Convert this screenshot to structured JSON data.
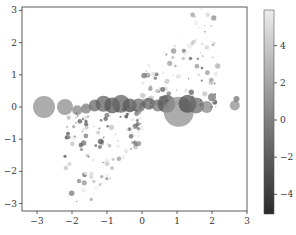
{
  "chart_data": {
    "type": "scatter",
    "title": "",
    "xlabel": "",
    "ylabel": "",
    "xlim": [
      -3.3,
      3.1
    ],
    "ylim": [
      -3.1,
      3.2
    ],
    "xticks": [
      -3,
      -2,
      -1,
      0,
      1,
      2,
      3
    ],
    "yticks": [
      -3,
      -2,
      -1,
      0,
      1,
      2,
      3
    ],
    "grid": false,
    "colormap": "gray",
    "colorbar": {
      "ticks": [
        4,
        2,
        0,
        -2,
        -4
      ],
      "range": [
        -5,
        5.5
      ],
      "position": "right"
    },
    "bubbles": [
      {
        "x": -2.8,
        "y": 0.0,
        "r": 11,
        "c": 0.5
      },
      {
        "x": -2.2,
        "y": 0.0,
        "r": 8,
        "c": 0.3
      },
      {
        "x": -1.85,
        "y": -0.1,
        "r": 5,
        "c": 0.0
      },
      {
        "x": -1.6,
        "y": -0.05,
        "r": 5,
        "c": -0.5
      },
      {
        "x": -1.35,
        "y": 0.05,
        "r": 6,
        "c": -1.5
      },
      {
        "x": -1.1,
        "y": 0.1,
        "r": 8,
        "c": -2.0
      },
      {
        "x": -0.85,
        "y": 0.05,
        "r": 8,
        "c": -2.5
      },
      {
        "x": -0.6,
        "y": 0.1,
        "r": 9,
        "c": -2.0
      },
      {
        "x": -0.35,
        "y": 0.05,
        "r": 7,
        "c": -2.5
      },
      {
        "x": -0.1,
        "y": 0.05,
        "r": 7,
        "c": -1.5
      },
      {
        "x": 0.2,
        "y": 0.1,
        "r": 6,
        "c": -2.0
      },
      {
        "x": 0.45,
        "y": 0.05,
        "r": 6,
        "c": -1.0
      },
      {
        "x": 0.7,
        "y": 0.1,
        "r": 9,
        "c": -2.5
      },
      {
        "x": 1.05,
        "y": -0.15,
        "r": 15,
        "c": 0.5
      },
      {
        "x": 1.3,
        "y": 0.1,
        "r": 9,
        "c": -3.0
      },
      {
        "x": 1.55,
        "y": 0.05,
        "r": 8,
        "c": -1.5
      },
      {
        "x": 1.85,
        "y": 0.0,
        "r": 6,
        "c": 0.0
      },
      {
        "x": 2.0,
        "y": 0.3,
        "r": 4,
        "c": -1.0
      },
      {
        "x": 2.65,
        "y": 0.05,
        "r": 5,
        "c": 0.5
      },
      {
        "x": 2.7,
        "y": 0.25,
        "r": 3,
        "c": -1.0
      }
    ]
  }
}
